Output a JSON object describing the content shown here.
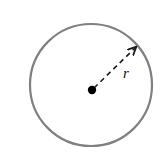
{
  "figure": {
    "background_color": "#ffffff",
    "width": 167,
    "height": 165
  },
  "circle": {
    "name": "circle-outline",
    "center_x": 91,
    "center_y": 85,
    "radius": 61,
    "stroke_color": "#808080",
    "stroke_width": 2.2,
    "fill": "none"
  },
  "center_point": {
    "name": "center-dot",
    "x": 92,
    "y": 90,
    "radius": 4.2,
    "color": "#000000"
  },
  "radius_line": {
    "name": "radius-dashed-arrow",
    "x1": 94,
    "y1": 88,
    "x2": 136,
    "y2": 47,
    "color": "#1a1a1a",
    "stroke_width": 1.6,
    "dash_pattern": "5 4",
    "arrowhead": "open-arrow-end"
  },
  "radius_label": {
    "name": "radius-label",
    "text": "r",
    "x": 123,
    "y": 78,
    "font_size": 15,
    "color": "#111111",
    "style": "italic"
  }
}
